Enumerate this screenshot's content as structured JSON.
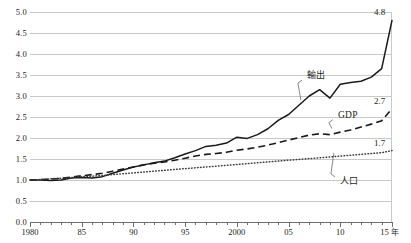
{
  "chart_data": {
    "type": "line",
    "title": "",
    "subtitle": "",
    "xlabel": "年",
    "ylabel": "",
    "xlim": [
      1980,
      2015
    ],
    "ylim": [
      0.0,
      5.0
    ],
    "grid": true,
    "legend_position": "inline-annotations",
    "note": "Index, 1980 = 1.0",
    "x": [
      1980,
      1981,
      1982,
      1983,
      1984,
      1985,
      1986,
      1987,
      1988,
      1989,
      1990,
      1991,
      1992,
      1993,
      1994,
      1995,
      1996,
      1997,
      1998,
      1999,
      2000,
      2001,
      2002,
      2003,
      2004,
      2005,
      2006,
      2007,
      2008,
      2009,
      2010,
      2011,
      2012,
      2013,
      2014,
      2015
    ],
    "yticks": [
      "0.0",
      "0.5",
      "1.0",
      "1.5",
      "2.0",
      "2.5",
      "3.0",
      "3.5",
      "4.0",
      "4.5",
      "5.0"
    ],
    "xticks_major": [
      {
        "year": 1980,
        "label": "1980"
      },
      {
        "year": 1985,
        "label": "85"
      },
      {
        "year": 1990,
        "label": "90"
      },
      {
        "year": 1995,
        "label": "95"
      },
      {
        "year": 2000,
        "label": "2000"
      },
      {
        "year": 2005,
        "label": "05"
      },
      {
        "year": 2010,
        "label": "10"
      },
      {
        "year": 2015,
        "label": "15"
      }
    ],
    "xtick_unit": "年",
    "series": [
      {
        "name": "輸出",
        "style": "solid",
        "end_value": "4.8",
        "label_x": 2006,
        "values": [
          1.0,
          1.0,
          0.99,
          1.0,
          1.05,
          1.06,
          1.05,
          1.08,
          1.16,
          1.24,
          1.31,
          1.36,
          1.41,
          1.45,
          1.53,
          1.62,
          1.7,
          1.8,
          1.83,
          1.88,
          2.02,
          1.99,
          2.08,
          2.22,
          2.42,
          2.56,
          2.78,
          3.0,
          3.15,
          2.95,
          3.28,
          3.32,
          3.35,
          3.45,
          3.65,
          4.8
        ]
      },
      {
        "name": "GDP",
        "style": "dashed",
        "end_value": "2.7",
        "label_x": 2009,
        "values": [
          1.0,
          1.01,
          1.02,
          1.04,
          1.07,
          1.1,
          1.13,
          1.16,
          1.21,
          1.26,
          1.31,
          1.36,
          1.4,
          1.43,
          1.47,
          1.52,
          1.57,
          1.61,
          1.63,
          1.66,
          1.71,
          1.74,
          1.78,
          1.83,
          1.89,
          1.95,
          2.01,
          2.07,
          2.1,
          2.08,
          2.14,
          2.19,
          2.26,
          2.33,
          2.41,
          2.7
        ]
      },
      {
        "name": "人口",
        "style": "dotted",
        "end_value": "1.7",
        "label_x": 2009,
        "values": [
          1.0,
          1.01,
          1.03,
          1.04,
          1.06,
          1.08,
          1.09,
          1.11,
          1.13,
          1.15,
          1.17,
          1.19,
          1.21,
          1.23,
          1.25,
          1.27,
          1.29,
          1.31,
          1.33,
          1.35,
          1.37,
          1.39,
          1.41,
          1.43,
          1.45,
          1.47,
          1.49,
          1.51,
          1.53,
          1.55,
          1.57,
          1.59,
          1.61,
          1.63,
          1.65,
          1.7
        ]
      }
    ]
  }
}
